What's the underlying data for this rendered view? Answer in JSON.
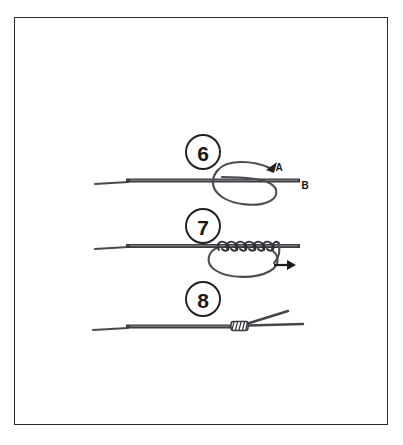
{
  "figure": {
    "background_color": "#ffffff",
    "border_color": "#2a2a2c",
    "ink_color": "#3a3a3e",
    "label_color": "#151517"
  },
  "steps": [
    {
      "number": "6",
      "badge_cx": 203,
      "badge_cy": 152,
      "badge_r": 17,
      "description": "Tag end crossed over standing line forming an open loop",
      "labels": [
        {
          "text": "A",
          "x": 279,
          "y": 167
        },
        {
          "text": "B",
          "x": 305,
          "y": 185
        }
      ]
    },
    {
      "number": "7",
      "badge_cx": 203,
      "badge_cy": 226,
      "badge_r": 17,
      "description": "Tag end wrapped in coils around the doubled line with loop held below",
      "wrap_count": 6,
      "labels": []
    },
    {
      "number": "8",
      "badge_cx": 203,
      "badge_cy": 299,
      "badge_r": 17,
      "description": "Knot drawn tight, coils seated against the standing line",
      "labels": []
    }
  ],
  "arrows": [
    {
      "name": "pull-direction-arrow",
      "x": 285,
      "y": 265,
      "direction": "right"
    },
    {
      "name": "tag-end-arrowhead-a",
      "x": 272,
      "y": 164,
      "direction": "up-right"
    }
  ]
}
